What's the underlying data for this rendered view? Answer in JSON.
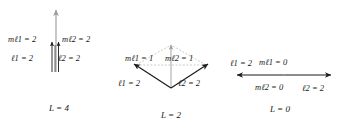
{
  "figure": {
    "colors": {
      "resultant_arrow": "#9a9a9a",
      "component_arrow": "#1a1a1a",
      "construction_line": "#a8a8a8",
      "text": "#1a1a1a",
      "background": "#ffffff"
    }
  },
  "panels": [
    {
      "id": "panel-1",
      "total_label": "L = 4",
      "total_symbol": "L",
      "total_value": "4",
      "vectors": [
        {
          "name": "vector-1",
          "m_label": "m",
          "m_sub": "ℓ1",
          "m_value": "2",
          "m_text": "mℓ1 = 2",
          "l_label": "ℓ",
          "l_sub": "1",
          "l_value": "2",
          "l_text": "ℓ1 = 2"
        },
        {
          "name": "vector-2",
          "m_label": "m",
          "m_sub": "ℓ2",
          "m_value": "2",
          "m_text": "mℓ2 = 2",
          "l_label": "ℓ",
          "l_sub": "2",
          "l_value": "2",
          "l_text": "ℓ2 = 2"
        }
      ]
    },
    {
      "id": "panel-2",
      "total_label": "L = 2",
      "total_symbol": "L",
      "total_value": "2",
      "vectors": [
        {
          "name": "vector-1",
          "m_label": "m",
          "m_sub": "ℓ1",
          "m_value": "1",
          "m_text": "mℓ1 = 1",
          "l_label": "ℓ",
          "l_sub": "1",
          "l_value": "2",
          "l_text": "ℓ1 = 2"
        },
        {
          "name": "vector-2",
          "m_label": "m",
          "m_sub": "ℓ2",
          "m_value": "1",
          "m_text": "mℓ2 = 1",
          "l_label": "ℓ",
          "l_sub": "2",
          "l_value": "2",
          "l_text": "ℓ2 = 2"
        }
      ]
    },
    {
      "id": "panel-3",
      "total_label": "L = 0",
      "total_symbol": "L",
      "total_value": "0",
      "vectors": [
        {
          "name": "vector-1",
          "m_label": "m",
          "m_sub": "ℓ1",
          "m_value": "0",
          "m_text": "mℓ1 = 0",
          "l_label": "ℓ",
          "l_sub": "1",
          "l_value": "2",
          "l_text": "ℓ1 = 2"
        },
        {
          "name": "vector-2",
          "m_label": "m",
          "m_sub": "ℓ2",
          "m_value": "0",
          "m_text": "mℓ2 = 0",
          "l_label": "ℓ",
          "l_sub": "2",
          "l_value": "2",
          "l_text": "ℓ2 = 2"
        }
      ]
    }
  ],
  "symbols": {
    "equals": "=",
    "m": "m",
    "ell": "ℓ",
    "L": "L"
  }
}
